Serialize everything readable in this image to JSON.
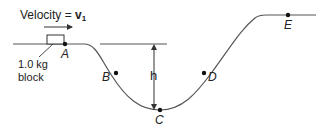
{
  "diagram": {
    "velocity_label": "Velocity = ",
    "velocity_symbol": "v",
    "velocity_subscript": "1",
    "block_label_line1": "1.0 kg",
    "block_label_line2": "block",
    "height_label": "h",
    "points": [
      {
        "id": "A",
        "label": "A"
      },
      {
        "id": "B",
        "label": "B"
      },
      {
        "id": "C",
        "label": "C"
      },
      {
        "id": "D",
        "label": "D"
      },
      {
        "id": "E",
        "label": "E"
      }
    ],
    "colors": {
      "line": "#555555",
      "text": "#222222",
      "dot": "#111111"
    }
  }
}
